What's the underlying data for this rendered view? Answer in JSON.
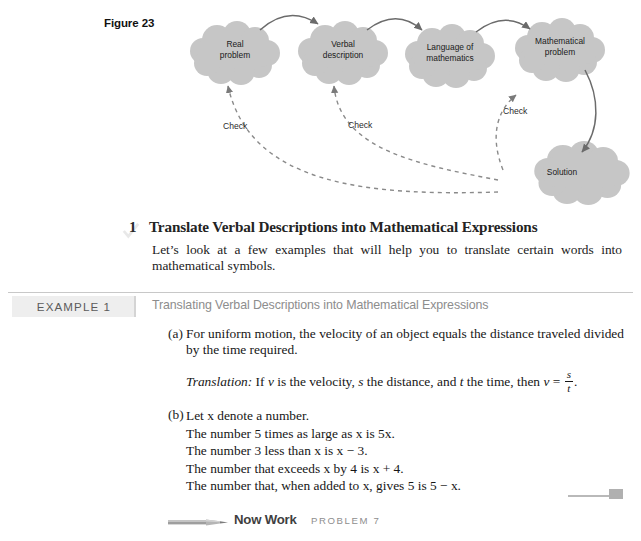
{
  "figure": {
    "label": "Figure 23",
    "clouds": [
      {
        "id": "real-problem",
        "line1": "Real",
        "line2": "problem"
      },
      {
        "id": "verbal-description",
        "line1": "Verbal",
        "line2": "description"
      },
      {
        "id": "language-of-math",
        "line1": "Language of",
        "line2": "mathematics"
      },
      {
        "id": "mathematical-problem",
        "line1": "Mathematical",
        "line2": "problem"
      },
      {
        "id": "solution",
        "line1": "Solution",
        "line2": ""
      }
    ],
    "check_labels": [
      "Check",
      "Check",
      "Check"
    ],
    "cloud_fill": "#c6c6c6",
    "arrow_color": "#6b6b6b"
  },
  "objective": {
    "number": "1",
    "title": "Translate Verbal Descriptions into Mathematical Expressions",
    "body": "Let’s look at a few examples that will help you to translate certain words into mathematical symbols."
  },
  "example": {
    "tag": "EXAMPLE 1",
    "title": "Translating Verbal Descriptions into Mathematical Expressions",
    "items": [
      {
        "marker": "(a)",
        "text": "For uniform motion, the velocity of an object equals the distance traveled divided by the time required.",
        "translation_label": "Translation:",
        "translation_text_1": "If",
        "var_v": "v",
        "translation_text_2": "is the velocity,",
        "var_s": "s",
        "translation_text_3": "the distance, and",
        "var_t": "t",
        "translation_text_4": "the time, then",
        "equation_lhs": "v",
        "equation_eq": "=",
        "fraction_numerator": "s",
        "fraction_denominator": "t",
        "equation_period": "."
      },
      {
        "marker": "(b)",
        "lead": "Let x denote a number.",
        "lines": [
          "The number 5 times as large as x is 5x.",
          "The number 3 less than x is x − 3.",
          "The number that exceeds x by 4 is x + 4.",
          "The number that, when added to x, gives 5 is 5 − x."
        ]
      }
    ]
  },
  "footer": {
    "now_work_label": "Now Work",
    "problem_label": "PROBLEM 7"
  }
}
